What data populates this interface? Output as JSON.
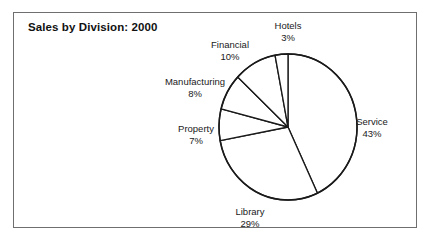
{
  "figure": {
    "title": "Sales by Division: 2000",
    "frame_color": "#6f6f6f",
    "background": "#ffffff",
    "line_color": "#1a1a1a"
  },
  "chart_data": {
    "type": "pie",
    "title": "Sales by Division: 2000",
    "xlabel": "",
    "ylabel": "",
    "units": "percent",
    "start_angle_deg": 0,
    "direction": "clockwise",
    "legend": "none",
    "grid": false,
    "labels": [
      "Service",
      "Library",
      "Property",
      "Manufacturing",
      "Financial",
      "Hotels"
    ],
    "values": [
      43,
      29,
      7,
      8,
      10,
      3
    ],
    "value_labels": [
      "43%",
      "29%",
      "7%",
      "8%",
      "10%",
      "3%"
    ],
    "slices": [
      {
        "label": "Service",
        "value": 43,
        "value_label": "43%",
        "color": "#ffffff"
      },
      {
        "label": "Library",
        "value": 29,
        "value_label": "29%",
        "color": "#ffffff"
      },
      {
        "label": "Property",
        "value": 7,
        "value_label": "7%",
        "color": "#ffffff"
      },
      {
        "label": "Manufacturing",
        "value": 8,
        "value_label": "8%",
        "color": "#ffffff"
      },
      {
        "label": "Financial",
        "value": 10,
        "value_label": "10%",
        "color": "#ffffff"
      },
      {
        "label": "Hotels",
        "value": 3,
        "value_label": "3%",
        "color": "#ffffff"
      }
    ],
    "geometry": {
      "cx": 288,
      "cy": 127,
      "rx": 69,
      "ry": 73
    },
    "label_positions": {
      "Service": {
        "left": 372,
        "top": 116,
        "align": "center"
      },
      "Library": {
        "left": 250,
        "top": 206,
        "align": "center"
      },
      "Property": {
        "left": 196,
        "top": 123,
        "align": "center"
      },
      "Manufacturing": {
        "left": 195,
        "top": 76,
        "align": "center"
      },
      "Financial": {
        "left": 230,
        "top": 39,
        "align": "center"
      },
      "Hotels": {
        "left": 288,
        "top": 20,
        "align": "center"
      }
    }
  }
}
